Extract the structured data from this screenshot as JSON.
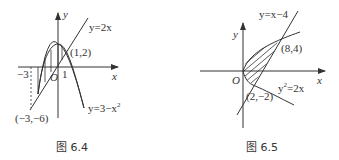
{
  "figures": [
    {
      "caption": "图 6.4",
      "axis_x": "x",
      "axis_y": "y",
      "origin": "O",
      "tick_labels": {
        "neg3": "−3",
        "one": "1"
      },
      "curves": [
        {
          "label": "y=2x",
          "type": "line"
        },
        {
          "label": "y=3−x",
          "sup": "2",
          "type": "parabola"
        }
      ],
      "points": [
        {
          "label": "(1,2)"
        },
        {
          "label": "(−3,−6)"
        }
      ],
      "shading": "vertical hatching between parabola and line from x=−3 to x=1"
    },
    {
      "caption": "图 6.5",
      "axis_x": "x",
      "axis_y": "y",
      "origin": "O",
      "curves": [
        {
          "label": "y=x−4",
          "type": "line"
        },
        {
          "label_pre": "y",
          "sup": "2",
          "label_post": "=2x",
          "type": "parabola"
        }
      ],
      "points": [
        {
          "label": "(8,4)"
        },
        {
          "label": "(2,−2)"
        }
      ],
      "shading": "diagonal hatching between parabola and line from y=−2 to y=4"
    }
  ],
  "colors": {
    "stroke": "#333333",
    "background": "#ffffff"
  }
}
